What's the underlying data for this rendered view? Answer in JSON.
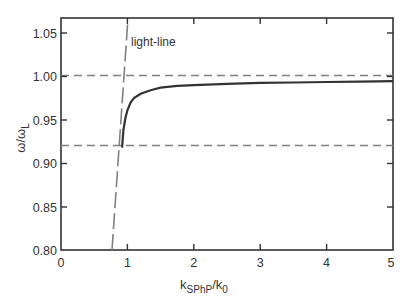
{
  "chart_data": {
    "type": "line",
    "title": "",
    "xlabel": "k_SPhP/k_0",
    "xlabel_main": "k",
    "xlabel_sub": "SPhP",
    "xlabel_den": "/k",
    "xlabel_den_sub": "0",
    "ylabel": "ω/ω_L",
    "ylabel_main": "ω/ω",
    "ylabel_sub": "L",
    "xlim": [
      0,
      5
    ],
    "ylim": [
      0.8,
      1.067
    ],
    "xticks": [
      "0",
      "1",
      "2",
      "3",
      "4",
      "5"
    ],
    "yticks": [
      "0.80",
      "0.85",
      "0.90",
      "0.95",
      "1.00",
      "1.05"
    ],
    "grid": false,
    "legend": null,
    "series": [
      {
        "name": "SPhP dispersion",
        "style": "solid",
        "color": "#333333",
        "x": [
          0.92,
          0.94,
          0.97,
          1.0,
          1.05,
          1.1,
          1.2,
          1.35,
          1.5,
          1.75,
          2.0,
          2.5,
          3.0,
          3.5,
          4.0,
          4.5,
          5.0
        ],
        "y": [
          0.918,
          0.938,
          0.952,
          0.961,
          0.97,
          0.975,
          0.98,
          0.984,
          0.987,
          0.989,
          0.99,
          0.9915,
          0.9925,
          0.993,
          0.9935,
          0.994,
          0.9945
        ]
      },
      {
        "name": "light-line",
        "style": "long-dash",
        "color": "#777777",
        "x": [
          0.77,
          1.0
        ],
        "y": [
          0.8,
          1.067
        ]
      },
      {
        "name": "ω_L",
        "style": "dashed",
        "color": "#777777",
        "x": [
          0,
          5
        ],
        "y": [
          1.001,
          1.001
        ]
      },
      {
        "name": "ω_T",
        "style": "dashed",
        "color": "#777777",
        "x": [
          0,
          5
        ],
        "y": [
          0.92,
          0.92
        ]
      }
    ],
    "annotations": [
      {
        "text": "light-line",
        "x": 1.0,
        "y": 1.04
      }
    ]
  }
}
